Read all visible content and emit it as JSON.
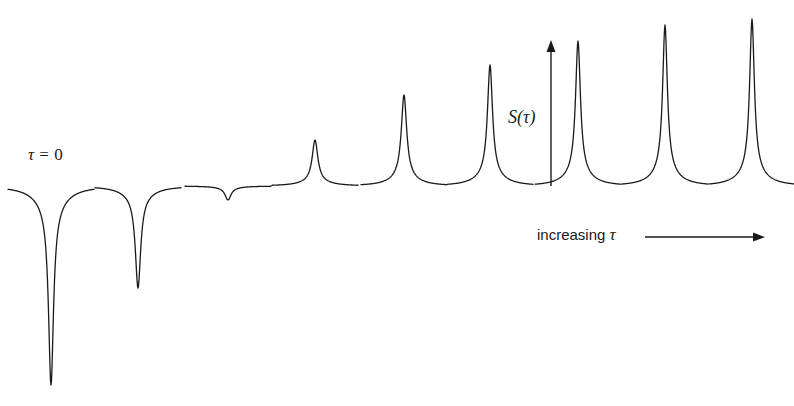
{
  "figure": {
    "background_color": "#ffffff",
    "line_color": "#1a1a1a",
    "width": 794,
    "height": 406,
    "baseline_y": 186
  },
  "annotations": {
    "tau_zero": {
      "prefix": "τ",
      "body": " = 0"
    },
    "signal_axis": "S(τ)",
    "increasing_tau": {
      "text": "increasing ",
      "symbol": "τ"
    }
  },
  "axes": {
    "vertical_arrow": {
      "x": 551,
      "y_bottom": 186,
      "y_top": 40
    },
    "horizontal_arrow": {
      "y": 237,
      "x_start": 645,
      "x_end": 765
    }
  },
  "chart_data": {
    "type": "line",
    "title": "",
    "subtitle": "",
    "xlabel": "increasing τ",
    "ylabel": "S(τ)",
    "grid": false,
    "legend": null,
    "baseline_y": 186,
    "x": [
      51,
      138,
      228,
      315,
      404,
      490,
      578,
      665,
      752
    ],
    "peak_extreme_y": [
      385,
      288,
      200,
      140,
      95,
      65,
      41,
      25,
      19
    ],
    "signed_amplitudes_px": [
      -199,
      -102,
      -14,
      46,
      91,
      121,
      145,
      161,
      167
    ],
    "halfwidths_px": [
      3.0,
      3.2,
      3.6,
      3.4,
      3.2,
      3.0,
      2.9,
      2.8,
      2.8
    ],
    "shoulder_halfwidths_px": [
      16,
      16,
      16,
      15,
      14,
      14,
      13,
      13,
      13
    ],
    "series": [
      {
        "name": "S(τ)",
        "values": [
          -199,
          -102,
          -14,
          46,
          91,
          121,
          145,
          161,
          167
        ]
      }
    ],
    "categories": [
      "τ = 0",
      "τ₂",
      "τ₃",
      "τ₄",
      "τ₅",
      "τ₆",
      "τ₇",
      "τ₈",
      "τ₉"
    ],
    "annotations_list": [
      "τ = 0",
      "S(τ)",
      "increasing τ"
    ]
  }
}
